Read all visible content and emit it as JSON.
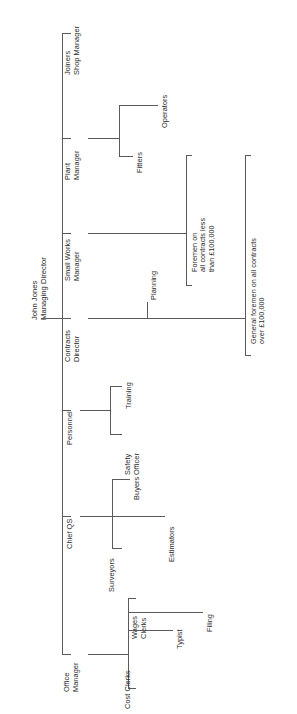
{
  "chart": {
    "type": "organisation-chart",
    "orientation": "rotated-90-counterclockwise",
    "root": {
      "name": "John Jones",
      "title": "Managing Director",
      "line1": "John Jones",
      "line2": "Managing Director"
    },
    "nodes": {
      "joiners_shop_manager": {
        "line1": "Joiners",
        "line2": "Shop Manager"
      },
      "plant_manager": {
        "line1": "Plant",
        "line2": "Manager"
      },
      "fitters": {
        "line1": "Fitters"
      },
      "operators": {
        "line1": "Operators"
      },
      "small_works_manager": {
        "line1": "Small Works",
        "line2": "Manager"
      },
      "contracts_director": {
        "line1": "Contracts",
        "line2": "Director"
      },
      "planning": {
        "line1": "Planning"
      },
      "foremen_small": {
        "line1": "Foremen on",
        "line2": "all contracts less",
        "line3": "than £100,000"
      },
      "general_foremen": {
        "line1": "General foremen on all contracts",
        "line2": "over £100,000"
      },
      "personnel": {
        "line1": "Personnel"
      },
      "training": {
        "line1": "Training"
      },
      "safety_officer": {
        "line1": "Safety",
        "line2": "Officer"
      },
      "chief_qs": {
        "line1": "Chief QS"
      },
      "buyers": {
        "line1": "Buyers"
      },
      "estimators": {
        "line1": "Estimators"
      },
      "surveyors": {
        "line1": "Surveyors"
      },
      "office_manager": {
        "line1": "Office",
        "line2": "Manager"
      },
      "wages_clerks": {
        "line1": "Wages",
        "line2": "Clerks"
      },
      "typist": {
        "line1": "Typist"
      },
      "filing": {
        "line1": "Filing"
      },
      "cost_clerks": {
        "line1": "Cost Clerks"
      }
    },
    "hierarchy": [
      {
        "label": "John Jones Managing Director",
        "children": [
          "Joiners Shop Manager",
          "Plant Manager",
          "Small Works Manager",
          "Contracts Director",
          "Personnel",
          "Chief QS",
          "Office Manager"
        ]
      },
      {
        "label": "Plant Manager",
        "children": [
          "Fitters",
          "Operators"
        ]
      },
      {
        "label": "Contracts Director",
        "children": [
          "Planning",
          "Foremen on all contracts less than £100,000",
          "General foremen on all contracts over £100,000"
        ]
      },
      {
        "label": "Personnel",
        "children": [
          "Training",
          "Safety Officer"
        ]
      },
      {
        "label": "Chief QS",
        "children": [
          "Buyers",
          "Estimators",
          "Surveyors"
        ]
      },
      {
        "label": "Office Manager",
        "children": [
          "Wages Clerks",
          "Typist",
          "Filing",
          "Cost Clerks"
        ]
      }
    ],
    "colors": {
      "line": "#5a5a5a",
      "text": "#2b2b2b",
      "background": "#ffffff"
    }
  }
}
